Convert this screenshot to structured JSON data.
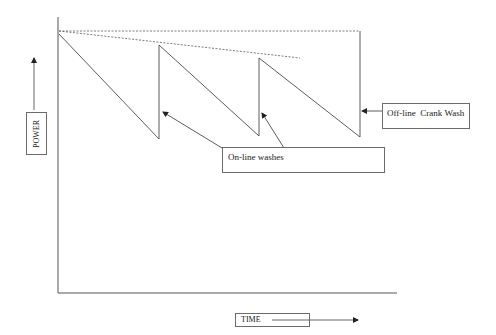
{
  "diagram": {
    "type": "sawtooth power degradation",
    "axes": {
      "y_label": "POWER",
      "x_label": "TIME"
    },
    "annotations": {
      "online_washes": "On-line washes",
      "offline_wash": "Off-line  Crank Wash"
    },
    "colors": {
      "line": "#4a4a4a",
      "dashed": "#5a5a5a",
      "box_border": "#6b6b6b",
      "text": "#1a1a1a"
    }
  }
}
